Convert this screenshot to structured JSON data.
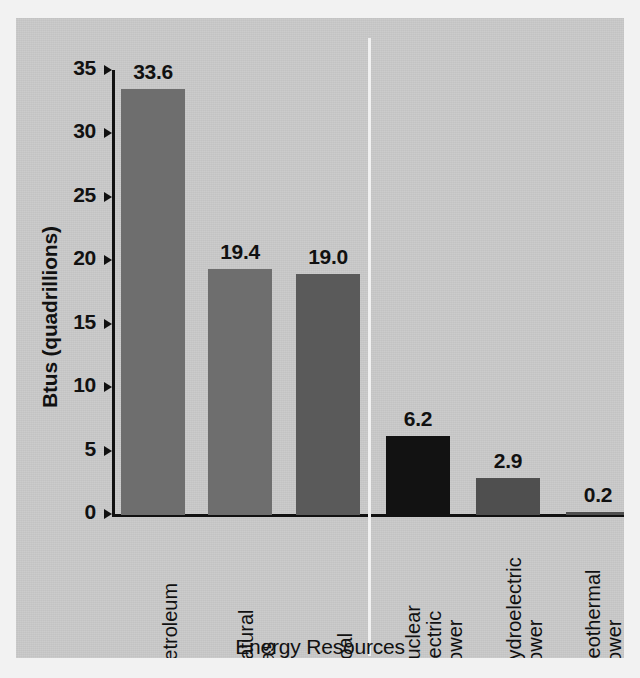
{
  "chart_data": {
    "type": "bar",
    "title": "",
    "xlabel": "Energy Resources",
    "ylabel": "Btus (quadrillions)",
    "categories": [
      "Petroleum",
      "Natural gas",
      "Coal",
      "Nuclear electric power",
      "Hydroelectric power",
      "Geothermal power and other"
    ],
    "category_lines": [
      [
        "Petroleum"
      ],
      [
        "Natural",
        "gas"
      ],
      [
        "Coal"
      ],
      [
        "Nuclear",
        "electric",
        "power"
      ],
      [
        "Hydroelectric",
        "power"
      ],
      [
        "Geothermal",
        "power",
        "and other"
      ]
    ],
    "values": [
      33.6,
      19.4,
      19.0,
      6.2,
      2.9,
      0.2
    ],
    "value_labels": [
      "33.6",
      "19.4",
      "19.0",
      "6.2",
      "2.9",
      "0.2"
    ],
    "bar_colors": [
      "#6e6e6e",
      "#6e6e6e",
      "#5a5a5a",
      "#121212",
      "#4f4f4f",
      "#4f4f4f"
    ],
    "ylim": [
      0,
      35
    ],
    "yticks": [
      35,
      30,
      25,
      20,
      15,
      10,
      5,
      0
    ],
    "ytick_labels": [
      "35",
      "30",
      "25",
      "20",
      "15",
      "10",
      "5",
      "0"
    ],
    "grid": false,
    "legend": null,
    "group_divider_after_index": 2,
    "background_color": "#c9c9c9",
    "axis_color": "#111111",
    "text_color": "#111111"
  },
  "geometry": {
    "bar_left_px": [
      9,
      96,
      184,
      274,
      364,
      454
    ],
    "bar_width_px": 64
  }
}
